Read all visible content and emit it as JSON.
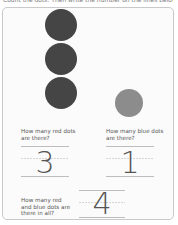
{
  "worksheet": {
    "instruction": "Count the dots. Then write the number on the lines below.",
    "colors": {
      "red_dot": "#454545",
      "blue_dot": "#8c8c8c",
      "card_border": "#c9c9c9",
      "text": "#555555"
    },
    "red_dots": {
      "count": 3
    },
    "blue_dots": {
      "count": 1
    },
    "questions": [
      {
        "id": "red",
        "text_line1": "How many red dots",
        "text_line2": "are there?",
        "answer": "3"
      },
      {
        "id": "blue",
        "text_line1": "How many blue dots",
        "text_line2": "are there?",
        "answer": "1"
      },
      {
        "id": "total",
        "text_line1": "How many red",
        "text_line2": "and blue dots are",
        "text_line3": "there in all?",
        "answer": "4"
      }
    ]
  }
}
